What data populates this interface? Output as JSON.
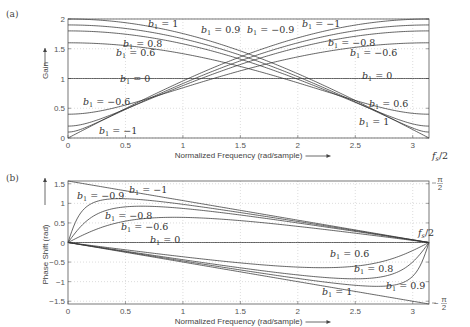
{
  "chart_data": [
    {
      "panel": "(a)",
      "type": "line",
      "title": "",
      "xlabel": "Normalized Frequency (rad/sample)",
      "ylabel": "Gain",
      "xlim": [
        0,
        3.14159
      ],
      "ylim": [
        0,
        2
      ],
      "xticks": [
        "0",
        "0.5",
        "1",
        "1.5",
        "2",
        "2.5",
        "3"
      ],
      "yticks": [
        "0",
        "0.5",
        "1",
        "1.5",
        "2"
      ],
      "grid": true,
      "right_annotation": "f_s/2",
      "formula": "|1 + b1·e^{-jω}|",
      "series": [
        {
          "name": "b1 = 1",
          "b1": 1
        },
        {
          "name": "b1 = 0.9",
          "b1": 0.9
        },
        {
          "name": "b1 = 0.8",
          "b1": 0.8
        },
        {
          "name": "b1 = 0.6",
          "b1": 0.6
        },
        {
          "name": "b1 = 0",
          "b1": 0
        },
        {
          "name": "b1 = -0.6",
          "b1": -0.6
        },
        {
          "name": "b1 = -0.8",
          "b1": -0.8
        },
        {
          "name": "b1 = -0.9",
          "b1": -0.9
        },
        {
          "name": "b1 = -1",
          "b1": -1
        }
      ],
      "sample_values": {
        "x": [
          0,
          0.5,
          1,
          1.5,
          2,
          2.5,
          3.14159
        ],
        "b1=1": [
          2.0,
          1.94,
          1.76,
          1.46,
          1.08,
          0.63,
          0.0
        ],
        "b1=0.6": [
          1.6,
          1.55,
          1.41,
          1.2,
          0.97,
          0.69,
          0.4
        ],
        "b1=0": [
          1,
          1,
          1,
          1,
          1,
          1,
          1
        ],
        "b1=-0.6": [
          0.4,
          0.58,
          0.89,
          1.21,
          1.49,
          1.67,
          1.6
        ],
        "b1=-1": [
          0.0,
          0.49,
          0.96,
          1.36,
          1.68,
          1.9,
          2.0
        ]
      },
      "annotations": [
        "b1 = 1",
        "b1 = 0.9",
        "b1 = -0.9",
        "b1 = -1",
        "b1 = 0.8",
        "b1 = 0.6",
        "b1 = -0.8",
        "b1 = -0.6",
        "b1 = 0",
        "b1 = -0.6",
        "b1 = 0.6",
        "b1 = -1",
        "b1 = 1"
      ]
    },
    {
      "panel": "(b)",
      "type": "line",
      "title": "",
      "xlabel": "Normalized Frequency (rad/sample)",
      "ylabel": "Phase Shift (rad)",
      "xlim": [
        0,
        3.14159
      ],
      "ylim": [
        -1.5708,
        1.5708
      ],
      "xticks": [
        "0",
        "0.5",
        "1",
        "1.5",
        "2",
        "2.5",
        "3"
      ],
      "yticks": [
        "-1.5",
        "-1",
        "-0.5",
        "0",
        "0.5",
        "1",
        "1.5"
      ],
      "right_yticks": [
        "π/2",
        "-π/2"
      ],
      "grid": true,
      "right_annotation": "f_s/2",
      "formula": "-atan(b1·sin ω / (1 + b1·cos ω))",
      "series": [
        {
          "name": "b1 = -1",
          "b1": -1
        },
        {
          "name": "b1 = -0.9",
          "b1": -0.9
        },
        {
          "name": "b1 = -0.8",
          "b1": -0.8
        },
        {
          "name": "b1 = -0.6",
          "b1": -0.6
        },
        {
          "name": "b1 = 0",
          "b1": 0
        },
        {
          "name": "b1 = 0.6",
          "b1": 0.6
        },
        {
          "name": "b1 = 0.8",
          "b1": 0.8
        },
        {
          "name": "b1 = 0.9",
          "b1": 0.9
        },
        {
          "name": "b1 = 1",
          "b1": 1
        }
      ],
      "sample_values": {
        "x": [
          0,
          0.5,
          1,
          1.5,
          2,
          2.5,
          3.14159
        ],
        "b1=-1": [
          1.571,
          1.321,
          1.071,
          0.821,
          0.571,
          0.321,
          0.0
        ],
        "b1=-0.6": [
          0.0,
          0.6,
          0.66,
          0.54,
          0.37,
          0.2,
          0.0
        ],
        "b1=0": [
          0,
          0,
          0,
          0,
          0,
          0,
          0
        ],
        "b1=0.6": [
          0.0,
          -0.2,
          -0.37,
          -0.54,
          -0.66,
          -0.6,
          0.0
        ],
        "b1=1": [
          0.0,
          -0.25,
          -0.5,
          -0.75,
          -1.0,
          -1.25,
          -1.571
        ]
      }
    }
  ],
  "panels": {
    "a": {
      "label": "(a)",
      "ylabel": "Gain",
      "xlabel": "Normalized Frequency (rad/sample)",
      "right_note": "f_s/2",
      "yticks": [
        {
          "v": 0,
          "t": "0"
        },
        {
          "v": 0.5,
          "t": "0.5"
        },
        {
          "v": 1,
          "t": "1"
        },
        {
          "v": 1.5,
          "t": "1.5"
        },
        {
          "v": 2,
          "t": "2"
        }
      ],
      "xticks": [
        {
          "v": 0,
          "t": "0"
        },
        {
          "v": 0.5,
          "t": "0.5"
        },
        {
          "v": 1,
          "t": "1"
        },
        {
          "v": 1.5,
          "t": "1.5"
        },
        {
          "v": 2,
          "t": "2"
        },
        {
          "v": 2.5,
          "t": "2.5"
        },
        {
          "v": 3,
          "t": "3"
        }
      ],
      "b_values": [
        1,
        0.9,
        0.8,
        0.6,
        0,
        -0.6,
        -0.8,
        -0.9,
        -1
      ],
      "labels": [
        {
          "text": "= 1",
          "x": 148,
          "y": 27
        },
        {
          "text": "= 0.9",
          "x": 201,
          "y": 33
        },
        {
          "text": "= −0.9",
          "x": 247,
          "y": 33
        },
        {
          "text": "= −1",
          "x": 302,
          "y": 27
        },
        {
          "text": "= 0.8",
          "x": 123,
          "y": 47
        },
        {
          "text": "= 0.6",
          "x": 116,
          "y": 56
        },
        {
          "text": "= −0.8",
          "x": 328,
          "y": 46
        },
        {
          "text": "= −0.6",
          "x": 350,
          "y": 56
        },
        {
          "text": "= 0",
          "x": 120,
          "y": 82
        },
        {
          "text": "= 0",
          "x": 362,
          "y": 79
        },
        {
          "text": "= −0.6",
          "x": 83,
          "y": 105
        },
        {
          "text": "= 0.6",
          "x": 369,
          "y": 107
        },
        {
          "text": "= −1",
          "x": 99,
          "y": 134
        },
        {
          "text": "= 1",
          "x": 359,
          "y": 125
        }
      ]
    },
    "b": {
      "label": "(b)",
      "ylabel": "Phase Shift (rad)",
      "xlabel": "Normalized Frequency (rad/sample)",
      "right_top": "π/2",
      "right_bottom": "−π/2",
      "fs_note": "f_s/2",
      "yticks": [
        {
          "v": 1.5,
          "t": "1.5"
        },
        {
          "v": 1,
          "t": "1"
        },
        {
          "v": 0.5,
          "t": "0.5"
        },
        {
          "v": 0,
          "t": "0"
        },
        {
          "v": -0.5,
          "t": "−0.5"
        },
        {
          "v": -1,
          "t": "−1"
        },
        {
          "v": -1.5,
          "t": "−1.5"
        }
      ],
      "xticks": [
        {
          "v": 0,
          "t": "0"
        },
        {
          "v": 0.5,
          "t": "0.5"
        },
        {
          "v": 1,
          "t": "1"
        },
        {
          "v": 1.5,
          "t": "1.5"
        },
        {
          "v": 2,
          "t": "2"
        },
        {
          "v": 2.5,
          "t": "2.5"
        },
        {
          "v": 3,
          "t": "3"
        }
      ],
      "b_values": [
        -1,
        -0.9,
        -0.8,
        -0.6,
        0,
        0.6,
        0.8,
        0.9,
        1
      ],
      "labels": [
        {
          "text": "= −1",
          "x": 129,
          "y": 193
        },
        {
          "text": "= −0.9",
          "x": 77,
          "y": 199
        },
        {
          "text": "= −0.8",
          "x": 105,
          "y": 219
        },
        {
          "text": "= −0.6",
          "x": 121,
          "y": 230
        },
        {
          "text": "= 0",
          "x": 150,
          "y": 243
        },
        {
          "text": "= 0.6",
          "x": 330,
          "y": 257
        },
        {
          "text": "= 0.8",
          "x": 354,
          "y": 272
        },
        {
          "text": "= 0.9",
          "x": 386,
          "y": 289
        },
        {
          "text": "= 1",
          "x": 322,
          "y": 295
        }
      ]
    }
  }
}
